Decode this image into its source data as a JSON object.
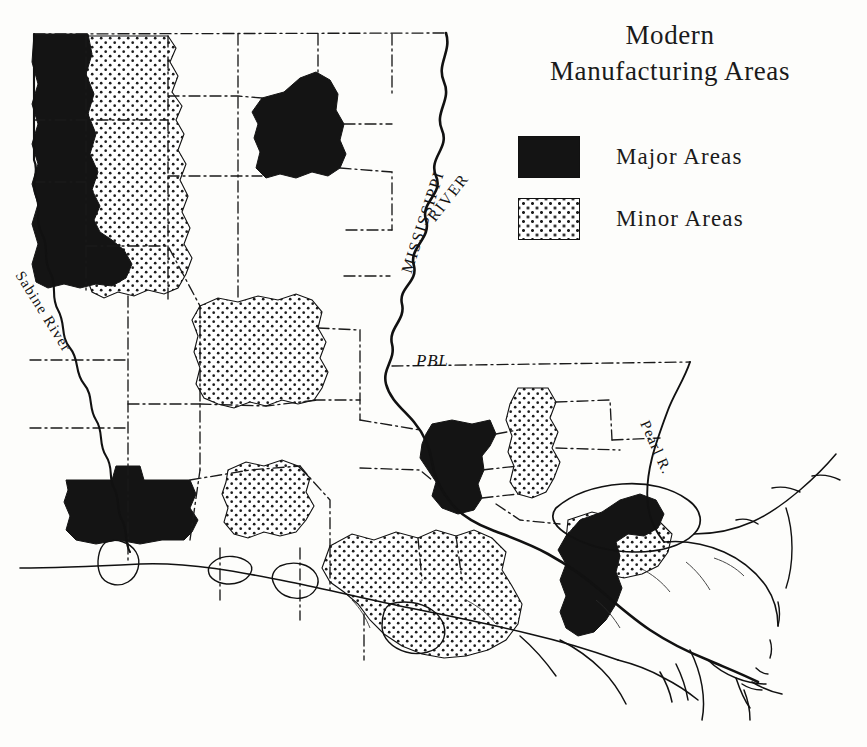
{
  "title": {
    "line1": "Modern",
    "line2": "Manufacturing  Areas"
  },
  "legend": {
    "items": [
      {
        "label": "Major  Areas",
        "pattern": "solid-black",
        "color": "#141414"
      },
      {
        "label": "Minor  Areas",
        "pattern": "stipple-dots",
        "color": "#1c1c1c"
      }
    ]
  },
  "map": {
    "subject": "Louisiana",
    "background_color": "#fdfdfb",
    "outline_color": "#111111",
    "parish_boundary_style": "dash-dot",
    "labels": [
      {
        "id": "sabine",
        "text": "Sabine River",
        "kind": "river-label"
      },
      {
        "id": "mississippi",
        "text": "MISSISSIPPI",
        "kind": "river-label"
      },
      {
        "id": "mississippi_river",
        "text": "RIVER",
        "kind": "river-label"
      },
      {
        "id": "pbl",
        "text": "PBL",
        "kind": "boundary-label"
      },
      {
        "id": "pearl",
        "text": "Pearl R.",
        "kind": "river-label"
      }
    ],
    "major_areas": [
      {
        "name": "northwest-shreveport",
        "description": "Caddo-Bossier, northwest corner"
      },
      {
        "name": "northeast-monroe",
        "description": "Ouachita, northeast"
      },
      {
        "name": "southwest-lake-charles",
        "description": "Calcasieu, southwest"
      },
      {
        "name": "baton-rouge",
        "description": "East Baton Rouge, south-central"
      },
      {
        "name": "new-orleans",
        "description": "Orleans-Jefferson-St. Bernard, southeast"
      }
    ],
    "minor_areas": [
      {
        "name": "northwest-stipple",
        "description": "East of Shreveport major area"
      },
      {
        "name": "central-alexandria",
        "description": "Rapides, central"
      },
      {
        "name": "west-central",
        "description": "West of center, above Lake Charles"
      },
      {
        "name": "florida-parishes-strip",
        "description": "Tangipahoa / Livingston vertical strip"
      },
      {
        "name": "acadiana",
        "description": "Lafayette / New Iberia, south-central"
      },
      {
        "name": "north-shore",
        "description": "St. Tammany, north of Lake Pontchartrain"
      }
    ]
  }
}
